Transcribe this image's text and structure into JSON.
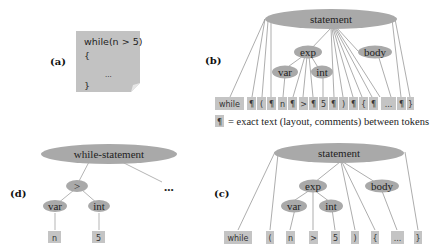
{
  "panels": {
    "a": {
      "label": "(a)",
      "code_lines": [
        "while(n > 5)",
        "{",
        "...",
        "}"
      ]
    },
    "b": {
      "label": "(b)",
      "root": "statement",
      "nodes": [
        "exp",
        "var",
        "int",
        "body"
      ],
      "tokens": [
        "while",
        "¶",
        "(",
        "¶",
        "n",
        "¶",
        ">",
        "¶",
        "5",
        "¶",
        ")",
        "¶",
        "{",
        "¶",
        "...",
        "¶",
        "}"
      ],
      "legend_symbol": "¶",
      "legend_text": "= exact text (layout, comments) between tokens"
    },
    "c": {
      "label": "(c)",
      "root": "statement",
      "nodes": [
        "exp",
        "var",
        "int",
        "body"
      ],
      "tokens": [
        "while",
        "(",
        "n",
        ">",
        "5",
        ")",
        "{",
        "...",
        "}"
      ]
    },
    "d": {
      "label": "(d)",
      "root": "while-statement",
      "nodes": [
        ">",
        "var",
        "int"
      ],
      "ellipsis": "...",
      "leaves": [
        "n",
        "5"
      ]
    }
  },
  "colors": {
    "node_fill": "#a9a9a9",
    "token_fill": "#c4c4c4",
    "paper_fill": "#c2c2c2",
    "edge": "#8a8a8a"
  }
}
